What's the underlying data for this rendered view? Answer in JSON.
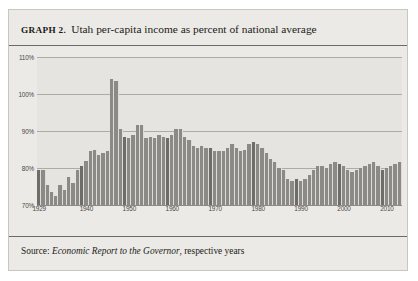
{
  "figure": {
    "label": "GRAPH 2.",
    "title": "Utah per-capita income as percent of national average",
    "source_prefix": "Source:",
    "source_italic": "Economic Report to the Governor",
    "source_suffix": ", respective years",
    "frame_color": "#c9c6c0",
    "plate_color": "#eceae6",
    "rule_color": "#6d6a63"
  },
  "chart_data": {
    "type": "bar",
    "title": "Utah per-capita income as percent of national average",
    "xlabel": "",
    "ylabel": "",
    "ylim": [
      70,
      110
    ],
    "yticks": [
      70,
      80,
      90,
      100,
      110
    ],
    "ytick_labels": [
      "70%",
      "80%",
      "90%",
      "100%",
      "110%"
    ],
    "xticks": [
      1929,
      1940,
      1950,
      1960,
      1970,
      1980,
      1990,
      2000,
      2010
    ],
    "xtick_labels": [
      "1929",
      "1940",
      "1950",
      "1960",
      "1970",
      "1980",
      "1990",
      "2000",
      "2010"
    ],
    "grid": true,
    "legend": null,
    "bar_color": "#8c8a86",
    "plot_background": "#e6e4e0",
    "categories": [
      1929,
      1930,
      1931,
      1932,
      1933,
      1934,
      1935,
      1936,
      1937,
      1938,
      1939,
      1940,
      1941,
      1942,
      1943,
      1944,
      1945,
      1946,
      1947,
      1948,
      1949,
      1950,
      1951,
      1952,
      1953,
      1954,
      1955,
      1956,
      1957,
      1958,
      1959,
      1960,
      1961,
      1962,
      1963,
      1964,
      1965,
      1966,
      1967,
      1968,
      1969,
      1970,
      1971,
      1972,
      1973,
      1974,
      1975,
      1976,
      1977,
      1978,
      1979,
      1980,
      1981,
      1982,
      1983,
      1984,
      1985,
      1986,
      1987,
      1988,
      1989,
      1990,
      1991,
      1992,
      1993,
      1994,
      1995,
      1996,
      1997,
      1998,
      1999,
      2000,
      2001,
      2002,
      2003,
      2004,
      2005,
      2006,
      2007,
      2008,
      2009,
      2010,
      2011,
      2012,
      2013
    ],
    "values": [
      79.5,
      79.5,
      75.5,
      73.5,
      72.5,
      75.5,
      74.0,
      77.5,
      76.0,
      79.5,
      80.5,
      82.0,
      84.5,
      85.0,
      83.5,
      84.0,
      84.5,
      104.0,
      103.5,
      90.5,
      88.5,
      88.0,
      89.0,
      91.5,
      91.5,
      88.0,
      88.5,
      88.0,
      89.0,
      88.5,
      88.0,
      89.0,
      90.5,
      90.5,
      88.5,
      87.5,
      86.0,
      85.5,
      86.0,
      85.5,
      85.5,
      84.5,
      84.5,
      84.5,
      85.5,
      86.5,
      85.5,
      84.5,
      85.0,
      86.5,
      87.0,
      86.5,
      85.5,
      84.0,
      82.5,
      81.5,
      80.0,
      79.5,
      77.0,
      76.5,
      77.0,
      76.5,
      77.0,
      78.0,
      79.5,
      80.5,
      80.5,
      80.0,
      81.0,
      81.5,
      81.0,
      80.5,
      79.5,
      79.0,
      79.5,
      80.0,
      80.5,
      81.0,
      81.5,
      80.5,
      79.5,
      80.0,
      80.5,
      81.0,
      81.5
    ],
    "peak": {
      "year": 1946,
      "value": 104.0
    },
    "trough": {
      "year": 1933,
      "value": 72.5
    }
  }
}
